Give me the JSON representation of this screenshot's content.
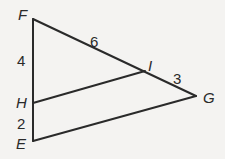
{
  "diagram": {
    "type": "triangle-with-parallel-segment",
    "vertices": {
      "F": {
        "x": 33,
        "y": 19
      },
      "E": {
        "x": 33,
        "y": 141
      },
      "G": {
        "x": 196,
        "y": 96
      },
      "H": {
        "x": 33,
        "y": 103
      },
      "I": {
        "x": 145,
        "y": 71
      }
    },
    "labels": {
      "F": "F",
      "E": "E",
      "G": "G",
      "H": "H",
      "I": "I"
    },
    "segment_lengths": {
      "FI": "6",
      "IG": "3",
      "FH": "4",
      "HE": "2"
    },
    "segments": [
      {
        "from": "F",
        "to": "E"
      },
      {
        "from": "F",
        "to": "G"
      },
      {
        "from": "E",
        "to": "G"
      },
      {
        "from": "H",
        "to": "I"
      }
    ]
  }
}
